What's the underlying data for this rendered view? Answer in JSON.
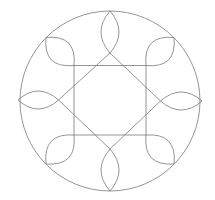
{
  "diagram": {
    "type": "geometric-pattern",
    "stroke_color": "#7a7a7a",
    "background": "#ffffff",
    "outer_circle": {
      "cx": 110,
      "cy": 101,
      "r": 90
    },
    "square": {
      "x": 74,
      "y": 65.5,
      "width": 72,
      "height": 69.5
    },
    "diamond": {
      "points": [
        [
          110,
          53
        ],
        [
          160.5,
          101
        ],
        [
          110,
          149
        ],
        [
          58.5,
          100
        ]
      ]
    },
    "axis_vesicas": [
      {
        "name": "top",
        "from": [
          110,
          11
        ],
        "to": [
          110,
          53
        ],
        "bulge": 9
      },
      {
        "name": "bottom",
        "from": [
          110,
          149
        ],
        "to": [
          110,
          191
        ],
        "bulge": 9
      },
      {
        "name": "left",
        "from": [
          18,
          100
        ],
        "to": [
          58.5,
          100
        ],
        "bulge": 9
      },
      {
        "name": "right",
        "from": [
          160.5,
          101
        ],
        "to": [
          202,
          101
        ],
        "bulge": 9
      }
    ],
    "corner_leaves": [
      {
        "name": "top-left",
        "from": [
          74,
          65.5
        ],
        "to": [
          46,
          37.5
        ],
        "bulge": 12
      },
      {
        "name": "top-right",
        "from": [
          146,
          65.5
        ],
        "to": [
          174,
          37.5
        ],
        "bulge": 12
      },
      {
        "name": "bottom-left",
        "from": [
          74,
          135
        ],
        "to": [
          46,
          164
        ],
        "bulge": 12
      },
      {
        "name": "bottom-right",
        "from": [
          146,
          135
        ],
        "to": [
          174,
          164
        ],
        "bulge": 12
      }
    ]
  }
}
